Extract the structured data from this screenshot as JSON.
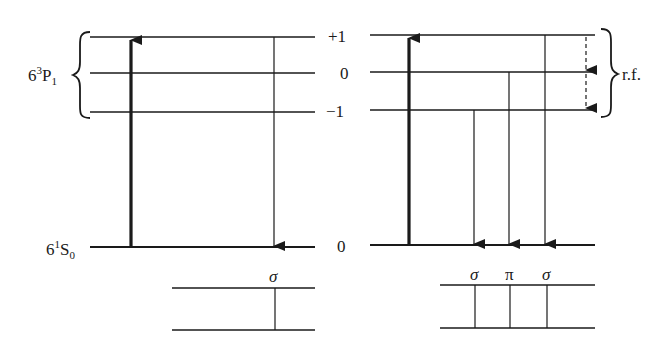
{
  "diagram": {
    "type": "energy-level diagram",
    "left_panel": {
      "excited_state": {
        "term": "6",
        "sup": "3",
        "letter": "P",
        "sub": "1"
      },
      "ground_state": {
        "term": "6",
        "sup": "1",
        "letter": "S",
        "sub": "0"
      },
      "transition_label": "σ"
    },
    "m_labels": {
      "plus_one": "+1",
      "zero": "0",
      "minus_one": "−1",
      "ground_zero": "0"
    },
    "right_panel": {
      "rf_label": "r.f.",
      "transition_labels": [
        "σ",
        "π",
        "σ"
      ]
    },
    "colors": {
      "line": "#1a1a1a",
      "background": "#ffffff"
    }
  }
}
